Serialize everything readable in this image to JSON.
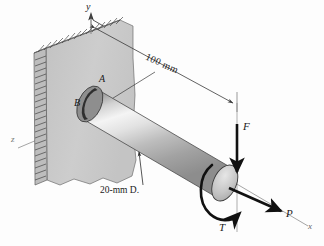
{
  "figure": {
    "background_color": "#fdfdfd",
    "width": 324,
    "height": 246
  },
  "axes": [
    {
      "name": "y-axis",
      "label": "y",
      "direction": "up",
      "x": 90,
      "y": 4
    },
    {
      "name": "z-axis",
      "label": "z",
      "direction": "left-down",
      "x": 14,
      "y": 140
    },
    {
      "name": "x-axis",
      "label": "x",
      "direction": "right-down",
      "x": 310,
      "y": 228
    }
  ],
  "points": [
    {
      "name": "point-a",
      "label": "A",
      "x": 101,
      "y": 80,
      "note": "top of shaft cross-section at wall"
    },
    {
      "name": "point-b",
      "label": "B",
      "x": 76,
      "y": 104,
      "note": "side of shaft cross-section at wall"
    }
  ],
  "dimensions": [
    {
      "name": "length-dimension",
      "label": "100 mm",
      "value": 100,
      "unit": "mm",
      "x": 156,
      "y": 60,
      "rotation": 24
    },
    {
      "name": "diameter-callout",
      "label": "20-mm D.",
      "value": 20,
      "unit": "mm",
      "x": 118,
      "y": 188
    }
  ],
  "loads": [
    {
      "name": "force-f",
      "label": "F",
      "direction": "downward transverse force at free end",
      "x": 249,
      "y": 128
    },
    {
      "name": "force-p",
      "label": "P",
      "direction": "axial force along x at free end",
      "x": 290,
      "y": 214
    },
    {
      "name": "torque-t",
      "label": "T",
      "direction": "torque about shaft axis at free end",
      "x": 223,
      "y": 228
    }
  ],
  "colors": {
    "wall_face": "#c7c7c7",
    "wall_edge": "#b0b0b0",
    "wall_top": "#d8d8d8",
    "shaft_light": "#f2f2f2",
    "shaft_mid": "#b4b4b4",
    "shaft_dark": "#6e6e6e",
    "end_cap": "#c0c0c0",
    "line": "#1a1a1a",
    "thin_line": "#555555"
  }
}
